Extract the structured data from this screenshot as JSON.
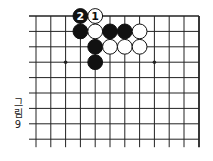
{
  "figure": {
    "caption_chars": [
      "그",
      "림",
      "9"
    ],
    "caption": "그림 9"
  },
  "board": {
    "columns": 12,
    "rows": 9,
    "x_positions": [
      36,
      50.8,
      65.6,
      80.4,
      95.2,
      110,
      124.8,
      139.6,
      154.4,
      169.2,
      184,
      199
    ],
    "y_positions": [
      16,
      31.4,
      46.8,
      62.2,
      77.6,
      93,
      108.4,
      123.8,
      139.2
    ],
    "top_edge": true,
    "right_edge": true,
    "star_points": [
      {
        "col": 2,
        "row": 3
      },
      {
        "col": 8,
        "row": 3
      }
    ],
    "stone_radius": 7.4,
    "line_color": "#222222",
    "stones": [
      {
        "col": 3,
        "row": 0,
        "color": "black",
        "label": "2"
      },
      {
        "col": 4,
        "row": 0,
        "color": "white",
        "label": "1"
      },
      {
        "col": 3,
        "row": 1,
        "color": "black",
        "label": ""
      },
      {
        "col": 4,
        "row": 1,
        "color": "white",
        "label": ""
      },
      {
        "col": 5,
        "row": 1,
        "color": "black",
        "label": ""
      },
      {
        "col": 6,
        "row": 1,
        "color": "black",
        "label": ""
      },
      {
        "col": 7,
        "row": 1,
        "color": "white",
        "label": ""
      },
      {
        "col": 4,
        "row": 2,
        "color": "black",
        "label": ""
      },
      {
        "col": 5,
        "row": 2,
        "color": "white",
        "label": ""
      },
      {
        "col": 6,
        "row": 2,
        "color": "white",
        "label": ""
      },
      {
        "col": 7,
        "row": 2,
        "color": "white",
        "label": ""
      },
      {
        "col": 4,
        "row": 3,
        "color": "black",
        "label": ""
      }
    ]
  }
}
